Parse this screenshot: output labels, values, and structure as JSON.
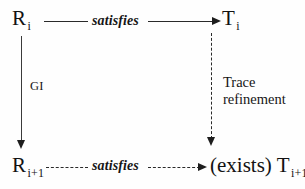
{
  "diagram": {
    "background_color": "#fefefe",
    "ink_color": "#1a1a1a",
    "nodes": [
      {
        "id": "r-i",
        "base": "R",
        "subscript": "i",
        "position": "top-left"
      },
      {
        "id": "t-i",
        "base": "T",
        "subscript": "i",
        "position": "top-right"
      },
      {
        "id": "r-i-plus-1",
        "base": "R",
        "subscript": "i+1",
        "position": "bottom-left"
      },
      {
        "id": "t-i-plus-1",
        "base": "(exists) T",
        "subscript": "i+1",
        "position": "bottom-right"
      }
    ],
    "edges": [
      {
        "id": "top-satisfies",
        "label": "satisfies",
        "from": "r-i",
        "to": "t-i",
        "style": "solid",
        "direction": "right",
        "label_style": "bold-italic"
      },
      {
        "id": "left-gi",
        "label": "GI",
        "from": "r-i",
        "to": "r-i-plus-1",
        "style": "solid",
        "direction": "down",
        "label_style": "plain"
      },
      {
        "id": "right-trace-refinement",
        "label_line1": "Trace",
        "label_line2": "refinement",
        "from": "t-i",
        "to": "t-i-plus-1",
        "style": "dashed",
        "direction": "down",
        "label_style": "plain"
      },
      {
        "id": "bottom-satisfies",
        "label": "satisfies",
        "from": "r-i-plus-1",
        "to": "t-i-plus-1",
        "style": "dashed",
        "direction": "right",
        "label_style": "bold-italic"
      }
    ]
  }
}
